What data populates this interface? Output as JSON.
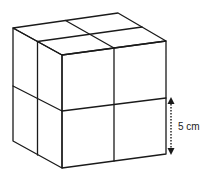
{
  "diagram": {
    "grid": "2x2x2",
    "dimension_label": "5 cm",
    "dimension_refers_to": "edge length of one small cube",
    "line_color": "#1a1a1a",
    "background": "#ffffff"
  }
}
